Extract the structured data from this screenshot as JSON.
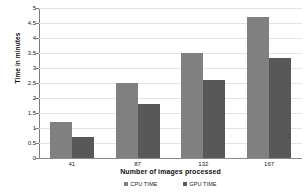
{
  "chart_data": {
    "type": "bar",
    "title": "",
    "categories": [
      "41",
      "87",
      "132",
      "167"
    ],
    "series": [
      {
        "name": "CPU TIME",
        "values": [
          1.2,
          2.5,
          3.5,
          4.7
        ],
        "color": "#808080"
      },
      {
        "name": "GPU TIME",
        "values": [
          0.7,
          1.8,
          2.6,
          3.35
        ],
        "color": "#585858"
      }
    ],
    "xlabel": "Number of images processed",
    "ylabel": "Time in minutes",
    "ylim": [
      0,
      5
    ],
    "ytick_labels": [
      "0",
      "0.5",
      "1",
      "1.5",
      "2",
      "2.5",
      "3",
      "3.5",
      "4",
      "4.5",
      "5"
    ],
    "ytick_values": [
      0,
      0.5,
      1,
      1.5,
      2,
      2.5,
      3,
      3.5,
      4,
      4.5,
      5
    ],
    "grid": true,
    "legend_position": "bottom",
    "background_color": "#ffffff",
    "gridline_color": "#e4e4e4",
    "axis_color": "#7d7d7d"
  }
}
